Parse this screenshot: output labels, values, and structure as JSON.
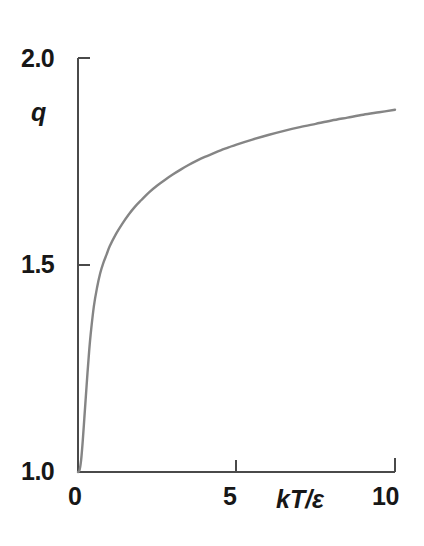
{
  "figure": {
    "background_color": "#ffffff",
    "axis_color": "#4a4a4a",
    "curve_color": "#858585"
  },
  "axes": {
    "y_title": "q",
    "x_title": "kT/ε",
    "y_ticks": [
      {
        "value": 2.0,
        "label": "2.0"
      },
      {
        "value": 1.5,
        "label": "1.5"
      },
      {
        "value": 1.0,
        "label": "1.0"
      }
    ],
    "x_ticks": [
      {
        "value": 0,
        "label": "0"
      },
      {
        "value": 5,
        "label": "5"
      },
      {
        "value": 10,
        "label": "10"
      }
    ]
  },
  "chart_data": {
    "type": "line",
    "title": "",
    "xlabel": "kT/ε",
    "ylabel": "q",
    "xlim": [
      0,
      10
    ],
    "ylim": [
      1.0,
      2.0
    ],
    "grid": false,
    "legend": null,
    "series": [
      {
        "name": "q",
        "color": "#858585",
        "x": [
          0.0,
          0.05,
          0.1,
          0.15,
          0.2,
          0.25,
          0.3,
          0.35,
          0.4,
          0.5,
          0.6,
          0.7,
          0.8,
          0.9,
          1.0,
          1.2,
          1.4,
          1.6,
          1.8,
          2.0,
          2.25,
          2.5,
          2.75,
          3.0,
          3.25,
          3.5,
          3.75,
          4.0,
          4.25,
          4.5,
          4.75,
          5.0,
          5.5,
          6.0,
          6.5,
          7.0,
          7.5,
          8.0,
          8.5,
          9.0,
          9.5,
          10.0
        ],
        "y": [
          1.0,
          1.005,
          1.03,
          1.075,
          1.13,
          1.185,
          1.24,
          1.29,
          1.333,
          1.4,
          1.445,
          1.48,
          1.505,
          1.525,
          1.545,
          1.575,
          1.6,
          1.622,
          1.641,
          1.657,
          1.676,
          1.692,
          1.706,
          1.719,
          1.731,
          1.742,
          1.752,
          1.761,
          1.769,
          1.777,
          1.784,
          1.791,
          1.803,
          1.814,
          1.824,
          1.833,
          1.841,
          1.849,
          1.856,
          1.863,
          1.869,
          1.875
        ]
      }
    ]
  }
}
